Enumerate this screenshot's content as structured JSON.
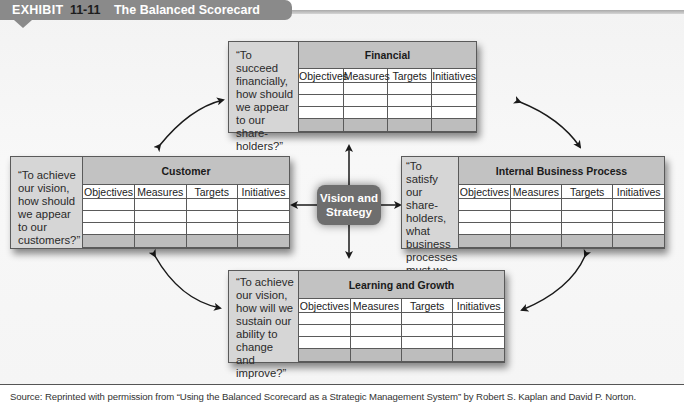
{
  "exhibit": {
    "label": "EXHIBIT",
    "number": "11-11",
    "title": "The Balanced Scorecard"
  },
  "center": {
    "line1": "Vision and",
    "line2": "Strategy"
  },
  "columns": [
    "Objectives",
    "Measures",
    "Targets",
    "Initiatives"
  ],
  "perspectives": {
    "financial": {
      "title": "Financial",
      "quote": "“To succeed financially, how should we appear to our share-holders?”"
    },
    "customer": {
      "title": "Customer",
      "quote": "“To achieve our vision, how should we appear to our customers?”"
    },
    "internal": {
      "title": "Internal Business Process",
      "quote": "“To satisfy our share-holders, what business processes must we excel at?”"
    },
    "learning": {
      "title": "Learning and Growth",
      "quote": "“To achieve our vision, how will we sustain our ability to change and improve?”"
    }
  },
  "source": "Source: Reprinted with permission from “Using the Balanced Scorecard as a Strategic Management System” by Robert S. Kaplan and David P. Norton.",
  "colors": {
    "banner": "#8a8a8a",
    "header": "#c2c2c2",
    "quote_panel": "#d6d6d6",
    "center_box": "#6e6e6e"
  }
}
